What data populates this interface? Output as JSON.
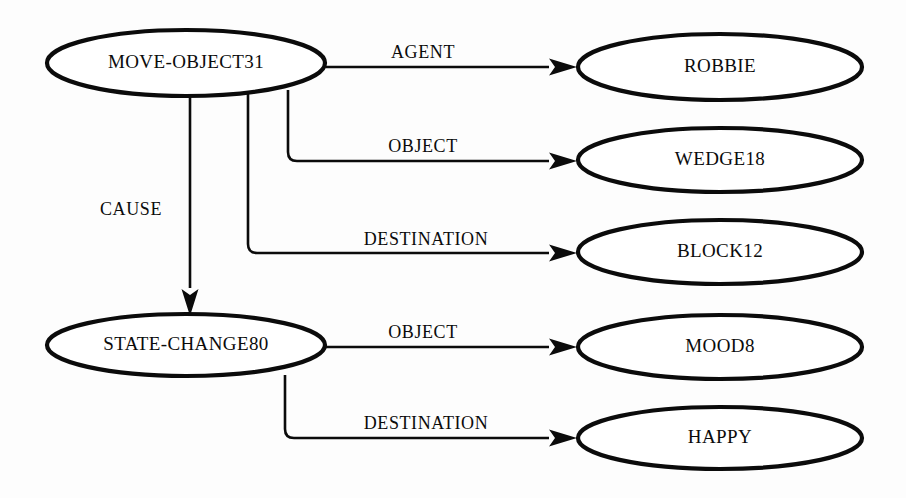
{
  "diagram": {
    "type": "semantic-network",
    "background_color": "#fdfdfd",
    "ink_color": "#0b0b0b",
    "canvas": {
      "width": 906,
      "height": 498
    },
    "nodes": [
      {
        "id": "move-object31",
        "label": "MOVE-OBJECT31",
        "cx": 186,
        "cy": 63,
        "rx": 139,
        "ry": 33,
        "font_size": 19
      },
      {
        "id": "robbie",
        "label": "ROBBIE",
        "cx": 720,
        "cy": 67,
        "rx": 142,
        "ry": 33,
        "font_size": 19
      },
      {
        "id": "wedge18",
        "label": "WEDGE18",
        "cx": 720,
        "cy": 160,
        "rx": 142,
        "ry": 32,
        "font_size": 19
      },
      {
        "id": "block12",
        "label": "BLOCK12",
        "cx": 720,
        "cy": 252,
        "rx": 142,
        "ry": 32,
        "font_size": 19
      },
      {
        "id": "state-change80",
        "label": "STATE-CHANGE80",
        "cx": 186,
        "cy": 345,
        "rx": 139,
        "ry": 31,
        "font_size": 19
      },
      {
        "id": "mood8",
        "label": "MOOD8",
        "cx": 720,
        "cy": 347,
        "rx": 142,
        "ry": 32,
        "font_size": 19
      },
      {
        "id": "happy",
        "label": "HAPPY",
        "cx": 720,
        "cy": 438,
        "rx": 142,
        "ry": 31,
        "font_size": 19
      }
    ],
    "edges": [
      {
        "id": "agent",
        "label": "AGENT",
        "from": "move-object31",
        "to": "robbie",
        "path": "M 326 67 L 549 67",
        "arrow_tip_x": 577,
        "arrow_tip_y": 67,
        "label_x": 423,
        "label_y": 58
      },
      {
        "id": "object-wedge18",
        "label": "OBJECT",
        "from": "move-object31",
        "to": "wedge18",
        "path": "M 288 90 L 288 152 Q 288 161 297 161 L 549 161",
        "arrow_tip_x": 577,
        "arrow_tip_y": 161,
        "label_x": 423,
        "label_y": 152
      },
      {
        "id": "destination-block12",
        "label": "DESTINATION",
        "from": "move-object31",
        "to": "block12",
        "path": "M 248 93 L 248 244 Q 248 253 257 253 L 549 253",
        "arrow_tip_x": 577,
        "arrow_tip_y": 253,
        "label_x": 426,
        "label_y": 245
      },
      {
        "id": "cause",
        "label": "CAUSE",
        "from": "move-object31",
        "to": "state-change80",
        "path": "M 190 94 L 190 288",
        "arrow_tip_x": 190,
        "arrow_tip_y": 316,
        "arrow_direction": "down",
        "label_x": 131,
        "label_y": 215
      },
      {
        "id": "object-mood8",
        "label": "OBJECT",
        "from": "state-change80",
        "to": "mood8",
        "path": "M 326 347 L 549 347",
        "arrow_tip_x": 577,
        "arrow_tip_y": 347,
        "label_x": 423,
        "label_y": 338
      },
      {
        "id": "destination-happy",
        "label": "DESTINATION",
        "from": "state-change80",
        "to": "happy",
        "path": "M 285 375 L 285 429 Q 285 438 294 438 L 549 438",
        "arrow_tip_x": 577,
        "arrow_tip_y": 438,
        "label_x": 426,
        "label_y": 429
      }
    ]
  }
}
